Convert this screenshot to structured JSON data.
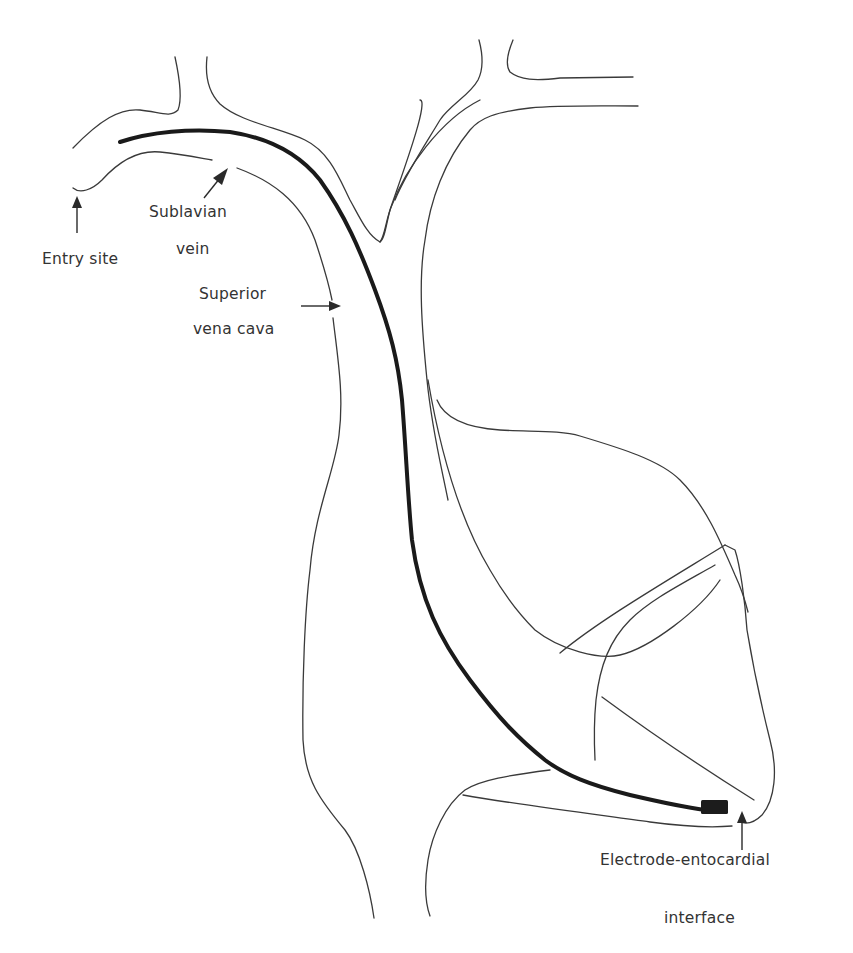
{
  "figure": {
    "colors": {
      "background": "#ffffff",
      "outline": "#3a3a3a",
      "lead": "#1a1a1a",
      "text": "#333333"
    }
  },
  "labels": {
    "entry_site": "Entry site",
    "subclavian_line1": "Sublavian",
    "subclavian_line2": "vein",
    "svc_line1": "Superior",
    "svc_line2": "vena cava",
    "electrode_line1": "Electrode-entocardial",
    "electrode_line2": "interface"
  },
  "icons": {
    "entry_arrow": "arrow-up-icon",
    "subclavian_arrow": "arrow-up-right-icon",
    "svc_arrow": "arrow-right-icon",
    "electrode_arrow": "arrow-up-icon"
  }
}
